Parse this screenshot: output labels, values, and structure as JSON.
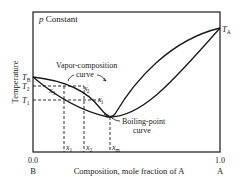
{
  "diagram": {
    "title": "p Constant",
    "title_italic": "p",
    "title_rest": "Constant",
    "y_axis_label": "Temperature",
    "x_axis_label": "Composition, mole fraction of A",
    "x_left_tick": "0.0",
    "x_left_component": "B",
    "x_right_tick": "1.0",
    "x_right_component": "A",
    "temperature_labels": {
      "TA": {
        "main": "T",
        "sub": "A"
      },
      "TB": {
        "main": "T",
        "sub": "B"
      },
      "T2": {
        "main": "T",
        "sub": "2"
      },
      "T1": {
        "main": "T",
        "sub": "1"
      }
    },
    "composition_labels": {
      "x1": {
        "main": "x",
        "sub": "1"
      },
      "x2": {
        "main": "x",
        "sub": "2"
      },
      "xm": {
        "main": "x",
        "sub": "m"
      },
      "x3": {
        "main": "x",
        "sub": "3"
      },
      "x2p": {
        "main": "x",
        "sub": "2",
        "prime": "′"
      },
      "x1p": {
        "main": "x",
        "sub": "1",
        "prime": "′"
      }
    },
    "curve_labels": {
      "vapor_line1": "Vapor-composition",
      "vapor_line2": "curve",
      "boiling_line1": "Boiling-point",
      "boiling_line2": "curve"
    },
    "colors": {
      "ink": "#1a1a1a",
      "background": "#ffffff"
    }
  }
}
